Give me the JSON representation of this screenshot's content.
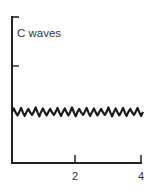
{
  "chart_data": {
    "type": "line",
    "title": "C waves",
    "xlabel": "",
    "ylabel": "",
    "x_ticks": [
      2,
      4
    ],
    "x_tick_labels": [
      "2",
      "4"
    ],
    "xlim": [
      0,
      4
    ],
    "y_ticks_unlabeled": 2,
    "grid": false,
    "legend": null,
    "series": [
      {
        "name": "C waves",
        "description": "small-amplitude irregular oscillation around a constant baseline (~half of y-axis height)",
        "baseline_fraction_of_axis": 0.35,
        "approx_cycles": 18
      }
    ]
  },
  "labels": {
    "title": "C waves",
    "tick2": "2",
    "tick4": "4"
  },
  "colors": {
    "ink": "#222222",
    "text": "#333333",
    "background": "#ffffff"
  }
}
